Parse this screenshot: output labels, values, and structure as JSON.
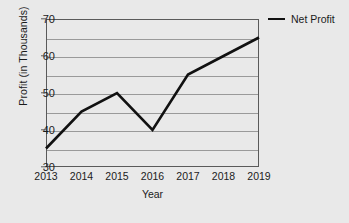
{
  "chart_data": {
    "type": "line",
    "title": "",
    "xlabel": "Year",
    "ylabel": "Profit (in Thousands)",
    "categories": [
      "2013",
      "2014",
      "2015",
      "2016",
      "2017",
      "2018",
      "2019"
    ],
    "series": [
      {
        "name": "Net Profit",
        "color": "#111111",
        "values": [
          35,
          45,
          50,
          40,
          55,
          60,
          65
        ]
      }
    ],
    "ylim": [
      30,
      70
    ],
    "y_major_ticks": [
      30,
      40,
      50,
      60,
      70
    ],
    "y_gridlines": [
      35,
      40,
      45,
      50,
      55,
      60,
      65
    ],
    "y_tick_labels": [
      "30",
      "40",
      "50",
      "60",
      "70"
    ],
    "grid": true,
    "legend_position": "top-right",
    "legend_entries": [
      "Net Profit"
    ],
    "background_color": "#e9e9e9",
    "gridline_color": "#9a9a9a",
    "axis_color": "#5a5a5a"
  }
}
